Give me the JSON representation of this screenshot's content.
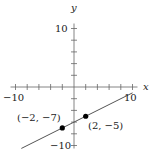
{
  "chart_data": {
    "type": "line",
    "title": "",
    "xlabel": "x",
    "ylabel": "y",
    "xlim": [
      -10,
      10
    ],
    "ylim": [
      -10,
      10
    ],
    "x_tick_step": 2,
    "y_tick_step": 2,
    "x_tick_labels": [
      "−10",
      "10"
    ],
    "y_tick_labels": [
      "10",
      "−10"
    ],
    "grid": false,
    "series": [
      {
        "name": "y = x/2 − 6",
        "x": [
          -9,
          10
        ],
        "y": [
          -10.5,
          -1
        ],
        "color": "#555555"
      }
    ],
    "points": [
      {
        "x": -2,
        "y": -7,
        "label": "(−2, −7)"
      },
      {
        "x": 2,
        "y": -5,
        "label": "(2, −5)"
      }
    ]
  }
}
